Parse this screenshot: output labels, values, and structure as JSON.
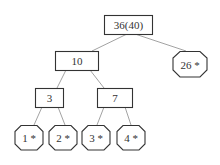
{
  "diagram": {
    "type": "tree",
    "nodes": [
      {
        "id": "root",
        "label": "36(40)",
        "shape": "rect"
      },
      {
        "id": "n10",
        "label": "10",
        "shape": "rect"
      },
      {
        "id": "n26",
        "label": "26 *",
        "shape": "octagon"
      },
      {
        "id": "n3",
        "label": "3",
        "shape": "rect"
      },
      {
        "id": "n7",
        "label": "7",
        "shape": "rect"
      },
      {
        "id": "l1",
        "label": "1 *",
        "shape": "octagon"
      },
      {
        "id": "l2",
        "label": "2 *",
        "shape": "octagon"
      },
      {
        "id": "l3",
        "label": "3 *",
        "shape": "octagon"
      },
      {
        "id": "l4",
        "label": "4 *",
        "shape": "octagon"
      }
    ],
    "edges": [
      [
        "root",
        "n10"
      ],
      [
        "root",
        "n26"
      ],
      [
        "n10",
        "n3"
      ],
      [
        "n10",
        "n7"
      ],
      [
        "n3",
        "l1"
      ],
      [
        "n3",
        "l2"
      ],
      [
        "n7",
        "l3"
      ],
      [
        "n7",
        "l4"
      ]
    ]
  }
}
